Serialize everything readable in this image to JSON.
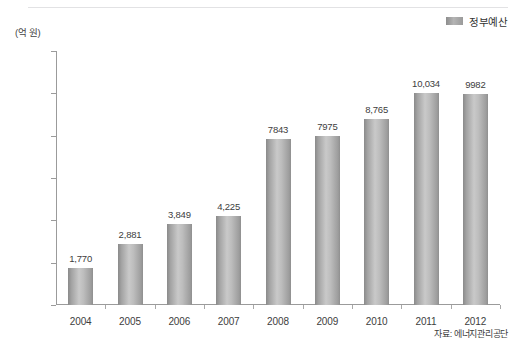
{
  "legend": {
    "label": "정부예산",
    "swatch_color": "#b4b4b4",
    "position": "top-right"
  },
  "yaxis": {
    "unit_label": "(억 원)",
    "ticks": [
      "0",
      "2,000",
      "4,000",
      "6,000",
      "8,000",
      "10,000",
      "12,000"
    ]
  },
  "source_note": "자료: 에너지관리공단",
  "chart_data": {
    "type": "bar",
    "title": "",
    "subtitle": "",
    "xlabel": "",
    "ylabel": "(억 원)",
    "ylim": [
      0,
      12000
    ],
    "ytick_interval": 2000,
    "grid": false,
    "legend_position": "top-right",
    "series": [
      {
        "name": "정부예산",
        "color": "#b4b4b4",
        "values": [
          1770,
          2881,
          3849,
          4225,
          7843,
          7975,
          8765,
          10034,
          9982
        ],
        "labels": [
          "1,770",
          "2,881",
          "3,849",
          "4,225",
          "7843",
          "7975",
          "8,765",
          "10,034",
          "9982"
        ]
      }
    ],
    "categories": [
      "2004",
      "2005",
      "2006",
      "2007",
      "2008",
      "2009",
      "2010",
      "2011",
      "2012"
    ],
    "annotations": [
      "자료: 에너지관리공단"
    ]
  }
}
